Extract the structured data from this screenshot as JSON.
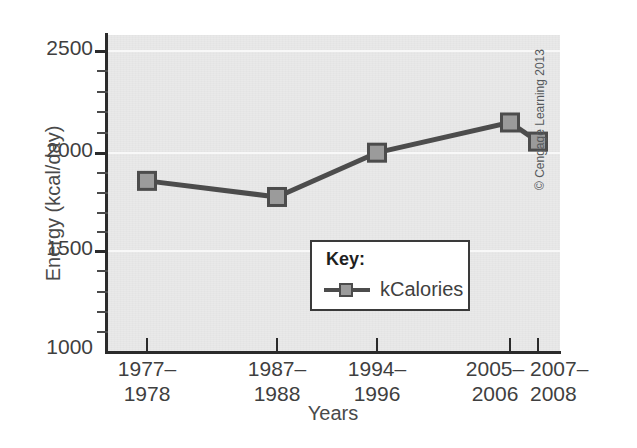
{
  "chart_data": {
    "type": "line",
    "title": "",
    "xlabel": "Years",
    "ylabel": "Energy (kcal/day)",
    "categories": [
      "1977–\n1978",
      "1987–\n1988",
      "1994–\n1996",
      "2005–\n2006",
      "2007–\n2008"
    ],
    "category_lines": [
      [
        "1977–",
        "1978"
      ],
      [
        "1987–",
        "1988"
      ],
      [
        "1994–",
        "1996"
      ],
      [
        "2005–",
        "2006"
      ],
      [
        "2007–",
        "2008"
      ]
    ],
    "series": [
      {
        "name": "kCalories",
        "values": [
          1850,
          1770,
          1990,
          2140,
          2045
        ]
      }
    ],
    "ylim": [
      1000,
      2560
    ],
    "ytick_major": [
      1000,
      1500,
      2000,
      2500
    ],
    "ytick_minor": [
      1100,
      1200,
      1300,
      1400,
      1600,
      1700,
      1800,
      1900,
      2100,
      2200,
      2300,
      2400,
      2500
    ],
    "ytick_labels": [
      "1000",
      "1500",
      "2000",
      "2500"
    ],
    "grid": true,
    "legend_position": "inside-center-lower",
    "legend": {
      "title": "Key:",
      "entries": [
        "kCalories"
      ]
    },
    "colors": {
      "plot_background": "#e9e9e9",
      "gridline": "#f8f8f8",
      "line": "#4c4c4c",
      "marker_fill": "#9b9b9b",
      "marker_edge": "#4c4c4c",
      "axis": "#2b2b2b",
      "text": "#3f3f3f"
    }
  },
  "credit": "© Cengage Learning 2013"
}
